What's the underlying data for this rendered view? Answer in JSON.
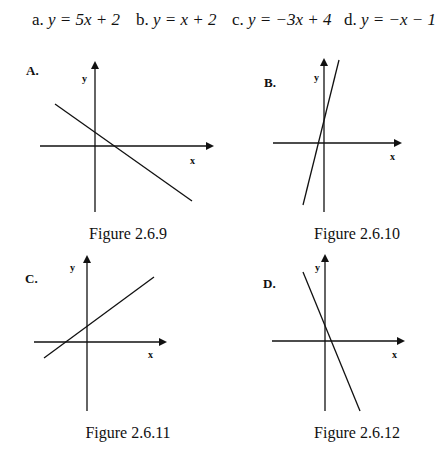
{
  "equations": [
    {
      "label": "a.",
      "expr": "y = 5x + 2"
    },
    {
      "label": "b.",
      "expr": "y = x + 2"
    },
    {
      "label": "c.",
      "expr": "y = −3x + 4"
    },
    {
      "label": "d.",
      "expr": "y = −x − 1"
    }
  ],
  "panels": [
    {
      "label": "A.",
      "caption": "Figure 2.6.9",
      "x_axis": "x",
      "y_axis": "y"
    },
    {
      "label": "B.",
      "caption": "Figure 2.6.10",
      "x_axis": "x",
      "y_axis": "y"
    },
    {
      "label": "C.",
      "caption": "Figure 2.6.11",
      "x_axis": "x",
      "y_axis": "y"
    },
    {
      "label": "D.",
      "caption": "Figure 2.6.12",
      "x_axis": "x",
      "y_axis": "y"
    }
  ]
}
